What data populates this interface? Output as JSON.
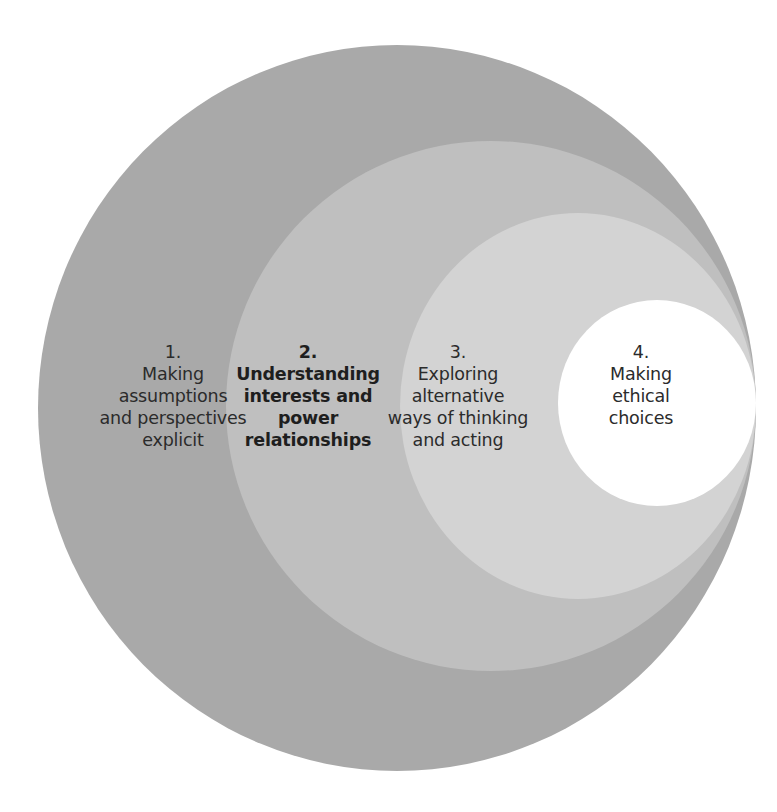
{
  "diagram": {
    "type": "nested-circles",
    "colors": {
      "ring1": "#a9a9a9",
      "ring2": "#bfbfbf",
      "ring3": "#d3d3d3",
      "ring4": "#ffffff",
      "text": "#2b2b2b",
      "background": "#ffffff"
    },
    "stages": [
      {
        "number": "1.",
        "lines": [
          "Making",
          "assumptions",
          "and perspectives",
          "explicit"
        ],
        "bold": false
      },
      {
        "number": "2.",
        "lines": [
          "Understanding",
          "interests and",
          "power",
          "relationships"
        ],
        "bold": true
      },
      {
        "number": "3.",
        "lines": [
          "Exploring",
          "alternative",
          "ways of thinking",
          "and acting"
        ],
        "bold": false
      },
      {
        "number": "4.",
        "lines": [
          "Making",
          "ethical",
          "choices"
        ],
        "bold": false
      }
    ]
  }
}
